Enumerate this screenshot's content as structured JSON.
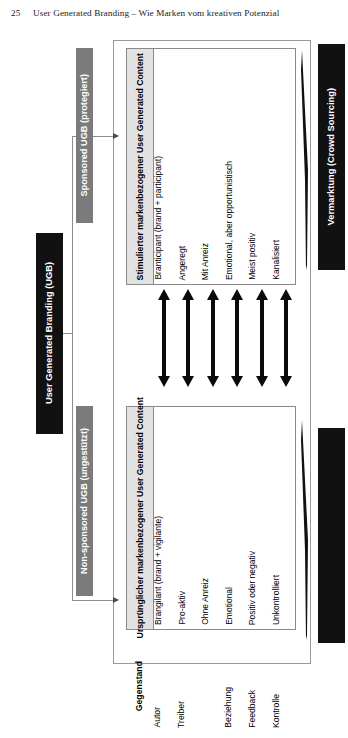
{
  "page": {
    "number": "25",
    "running_title": "User Generated Branding – Wie Marken vom kreativen Potenzial"
  },
  "root_box": {
    "label": "User Generated Branding (UGB)",
    "color": "#111111",
    "text_color": "#ffffff"
  },
  "branches": [
    {
      "id": "sponsored",
      "label": "Sponsored UGB (protegiert)",
      "color": "#7b7b7b"
    },
    {
      "id": "non-sponsored",
      "label": "Non-sponsored UGB (ungestützt)",
      "color": "#7b7b7b"
    }
  ],
  "outcome_boxes": [
    {
      "id": "vermarktung-top",
      "label": "Vermarktung (Crowd Sourcing)",
      "color": "#111111",
      "text_color": "#ffffff"
    },
    {
      "id": "vermarktung-bottom",
      "label": "",
      "color": "#111111",
      "text_color": "#ffffff"
    }
  ],
  "tables": {
    "upper": {
      "header": "Stimulierter markenbezogener User Generated Content",
      "cells": [
        "Branticipant (brand + participant)",
        "Angeregt",
        "Mit Anreiz",
        "Emotional, aber opportunistisch",
        "Meist positiv",
        "Kanalisiert"
      ]
    },
    "lower": {
      "header": "Ursprünglicher markenbezogener User Generated Content",
      "cells": [
        "Brangilant (brand + vigilante)",
        "Pro-aktiv",
        "Ohne Anreiz",
        "Emotional",
        "Positiv oder negativ",
        "Unkontrolliert"
      ]
    },
    "legend": {
      "header": "Gegenstand",
      "cells": [
        "Autor",
        "Treiber",
        "",
        "Beziehung",
        "Feedback",
        "Kontrolle"
      ]
    }
  },
  "connectors": {
    "double_arrow_count": 6,
    "double_arrow_color": "#0a0a0a",
    "line_color": "#8d8d8d"
  }
}
